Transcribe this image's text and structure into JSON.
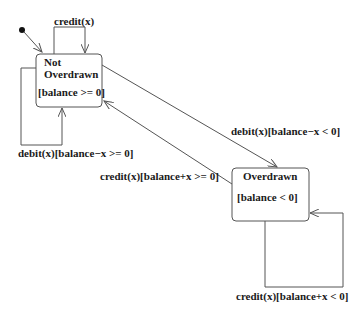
{
  "diagram": {
    "type": "uml-state-machine",
    "initial_state": "Not Overdrawn",
    "states": [
      {
        "id": "not-overdrawn",
        "name_line1": "Not",
        "name_line2": "Overdrawn",
        "invariant": "[balance >= 0]"
      },
      {
        "id": "overdrawn",
        "name": "Overdrawn",
        "invariant": "[balance < 0]"
      }
    ],
    "transitions": [
      {
        "id": "t1",
        "from": "not-overdrawn",
        "to": "not-overdrawn",
        "label": "credit(x)"
      },
      {
        "id": "t2",
        "from": "not-overdrawn",
        "to": "not-overdrawn",
        "label": "debit(x)[balance−x >= 0]"
      },
      {
        "id": "t3",
        "from": "not-overdrawn",
        "to": "overdrawn",
        "label": "debit(x)[balance−x < 0]"
      },
      {
        "id": "t4",
        "from": "overdrawn",
        "to": "not-overdrawn",
        "label": "credit(x)[balance+x >= 0]"
      },
      {
        "id": "t5",
        "from": "overdrawn",
        "to": "overdrawn",
        "label": "credit(x)[balance+x < 0]"
      }
    ],
    "colors": {
      "line": "#555555",
      "text": "#1a1a1a",
      "background": "#ffffff"
    }
  }
}
